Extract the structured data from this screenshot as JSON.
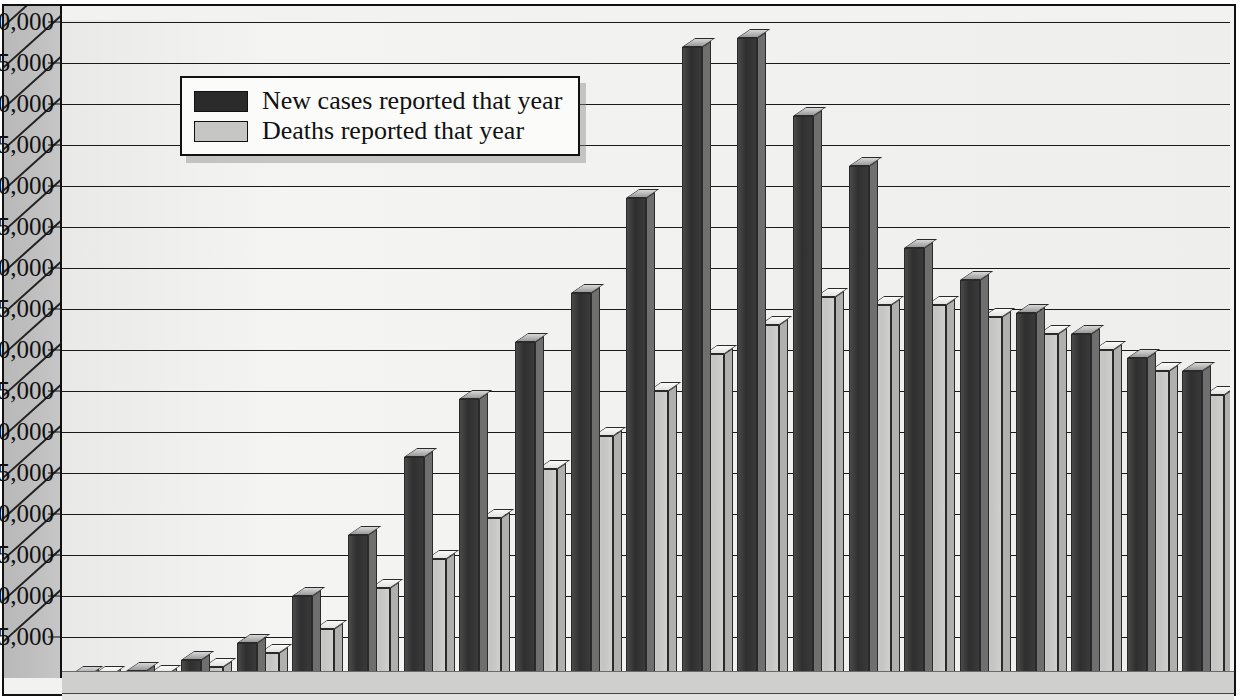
{
  "chart_data": {
    "type": "bar",
    "title": "",
    "xlabel": "",
    "ylabel": "",
    "ylim": [
      0,
      80000
    ],
    "ytick_step": 5000,
    "grid": true,
    "legend_position": "upper-left-inside",
    "style": "3d-clustered-column",
    "categories": [
      "1",
      "2",
      "3",
      "4",
      "5",
      "6",
      "7",
      "8",
      "9",
      "10",
      "11",
      "12",
      "13",
      "14",
      "15",
      "16",
      "17",
      "18",
      "19",
      "20",
      "21"
    ],
    "ytick_labels": [
      "5,000",
      "10,000",
      "15,000",
      "20,000",
      "25,000",
      "30,000",
      "35,000",
      "40,000",
      "45,000",
      "50,000",
      "55,000",
      "60,000",
      "65,000",
      "70,000",
      "75,000",
      "80,000"
    ],
    "ytick_values": [
      5000,
      10000,
      15000,
      20000,
      25000,
      30000,
      35000,
      40000,
      45000,
      50000,
      55000,
      60000,
      65000,
      70000,
      75000,
      80000
    ],
    "series": [
      {
        "name": "New cases reported that year",
        "color": "#2f2f2f",
        "values": [
          300,
          800,
          2200,
          4300,
          10000,
          17500,
          27000,
          34000,
          41000,
          47000,
          58500,
          77000,
          78000,
          68500,
          62500,
          52500,
          48500,
          44500,
          42000,
          39000,
          37500
        ]
      },
      {
        "name": "Deaths reported that year",
        "color": "#c6c6c4",
        "values": [
          200,
          500,
          1400,
          3000,
          6000,
          11000,
          14500,
          19500,
          25500,
          29500,
          35000,
          39500,
          43000,
          46500,
          45500,
          45500,
          44000,
          42000,
          40000,
          37500,
          34500
        ]
      }
    ]
  },
  "legend": {
    "entries": [
      {
        "label": "New cases reported that year",
        "swatch": "dark"
      },
      {
        "label": "Deaths reported that year",
        "swatch": "light"
      }
    ]
  },
  "colors": {
    "bar_dark": "#2f2f2f",
    "bar_light": "#c6c6c4",
    "gridline": "#1a1a1a",
    "plot_background": "#f1f1ef",
    "axis_wall": "#bdbdbd"
  }
}
